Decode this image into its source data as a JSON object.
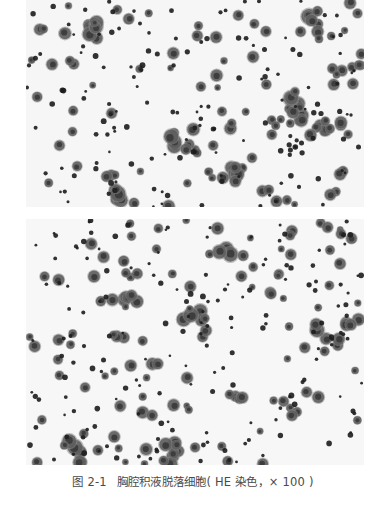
{
  "figure": {
    "label": "图 2-1",
    "title": "胸腔积液脱落细胞",
    "stain_note": "( HE 染色，× 100 )"
  },
  "images": [
    {
      "id": "top",
      "description": "HE-stained exfoliated cells, pleural effusion (field 1)",
      "width": 338,
      "height": 207,
      "background": "#f6f6f6",
      "seed": 17,
      "small_cells": 150,
      "medium_cells": 85,
      "clusters": [
        [
          70,
          25,
          9,
          20
        ],
        [
          160,
          140,
          8,
          18
        ],
        [
          265,
          110,
          9,
          20
        ],
        [
          300,
          130,
          8,
          18
        ],
        [
          285,
          20,
          6,
          16
        ],
        [
          210,
          175,
          5,
          12
        ],
        [
          90,
          190,
          5,
          14
        ],
        [
          330,
          60,
          4,
          14
        ]
      ]
    },
    {
      "id": "bottom",
      "description": "HE-stained exfoliated cells, pleural effusion (field 2)",
      "width": 338,
      "height": 246,
      "background": "#f7f7f7",
      "seed": 43,
      "small_cells": 170,
      "medium_cells": 110,
      "clusters": [
        [
          55,
          230,
          7,
          22
        ],
        [
          150,
          230,
          7,
          22
        ],
        [
          300,
          120,
          5,
          16
        ],
        [
          320,
          105,
          4,
          16
        ],
        [
          100,
          80,
          5,
          14
        ],
        [
          170,
          100,
          4,
          14
        ],
        [
          200,
          30,
          3,
          12
        ]
      ]
    }
  ],
  "colors": {
    "nucleus_dark": "#1e1e1e",
    "nucleus_mid": "#3a3a3a",
    "cytoplasm": "#5c5c5c",
    "cytoplasm_light": "#8a8a8a",
    "caption_text": "#4a4a4a"
  }
}
